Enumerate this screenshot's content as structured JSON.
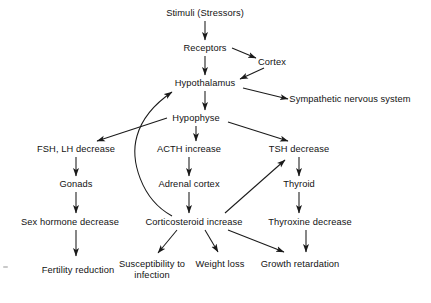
{
  "diagram": {
    "text_color": "#121212",
    "line_color": "#1a1a1a",
    "background": "#ffffff",
    "nodes": [
      {
        "id": "stimuli",
        "label": "Stimuli (Stressors)",
        "x": 205,
        "y": 13,
        "lines": 1
      },
      {
        "id": "receptors",
        "label": "Receptors",
        "x": 205,
        "y": 48,
        "lines": 1
      },
      {
        "id": "cortex",
        "label": "Cortex",
        "x": 272,
        "y": 62,
        "lines": 1
      },
      {
        "id": "hypothalamus",
        "label": "Hypothalamus",
        "x": 205,
        "y": 83,
        "lines": 1
      },
      {
        "id": "sympathetic",
        "label": "Sympathetic nervous system",
        "x": 350,
        "y": 99,
        "lines": 1
      },
      {
        "id": "hypophyse",
        "label": "Hypophyse",
        "x": 196,
        "y": 118,
        "lines": 1
      },
      {
        "id": "fsh_lh",
        "label": "FSH, LH decrease",
        "x": 76,
        "y": 149,
        "lines": 1
      },
      {
        "id": "acth",
        "label": "ACTH increase",
        "x": 189,
        "y": 149,
        "lines": 1
      },
      {
        "id": "tsh",
        "label": "TSH decrease",
        "x": 299,
        "y": 149,
        "lines": 1
      },
      {
        "id": "gonads",
        "label": "Gonads",
        "x": 76,
        "y": 184,
        "lines": 1
      },
      {
        "id": "adrenal_cortex",
        "label": "Adrenal cortex",
        "x": 189,
        "y": 184,
        "lines": 1
      },
      {
        "id": "thyroid",
        "label": "Thyroid",
        "x": 299,
        "y": 184,
        "lines": 1
      },
      {
        "id": "sex_hormone",
        "label": "Sex hormone decrease",
        "x": 70,
        "y": 222,
        "lines": 1
      },
      {
        "id": "corticosteroid",
        "label": "Corticosteroid increase",
        "x": 194,
        "y": 222,
        "lines": 1
      },
      {
        "id": "thyroxine",
        "label": "Thyroxine decrease",
        "x": 310,
        "y": 222,
        "lines": 1
      },
      {
        "id": "fertility",
        "label": "Fertility reduction",
        "x": 78,
        "y": 270,
        "lines": 2
      },
      {
        "id": "susceptibility",
        "label": "Susceptibility to infection",
        "x": 152,
        "y": 270,
        "lines": 2
      },
      {
        "id": "weight_loss",
        "label": "Weight loss",
        "x": 220,
        "y": 264,
        "lines": 1
      },
      {
        "id": "growth",
        "label": "Growth retardation",
        "x": 300,
        "y": 264,
        "lines": 1
      }
    ],
    "edges": [
      {
        "from": "stimuli",
        "to": "receptors",
        "kind": "straight"
      },
      {
        "from": "receptors",
        "to": "cortex",
        "kind": "straight"
      },
      {
        "from": "cortex",
        "to": "hypothalamus",
        "kind": "straight"
      },
      {
        "from": "receptors",
        "to": "hypothalamus",
        "kind": "straight"
      },
      {
        "from": "hypothalamus",
        "to": "sympathetic",
        "kind": "straight"
      },
      {
        "from": "hypothalamus",
        "to": "hypophyse",
        "kind": "straight"
      },
      {
        "from": "hypophyse",
        "to": "fsh_lh",
        "kind": "straight"
      },
      {
        "from": "hypophyse",
        "to": "acth",
        "kind": "straight"
      },
      {
        "from": "hypophyse",
        "to": "tsh",
        "kind": "straight"
      },
      {
        "from": "fsh_lh",
        "to": "gonads",
        "kind": "straight"
      },
      {
        "from": "acth",
        "to": "adrenal_cortex",
        "kind": "straight"
      },
      {
        "from": "tsh",
        "to": "thyroid",
        "kind": "straight"
      },
      {
        "from": "gonads",
        "to": "sex_hormone",
        "kind": "straight"
      },
      {
        "from": "adrenal_cortex",
        "to": "corticosteroid",
        "kind": "straight"
      },
      {
        "from": "thyroid",
        "to": "thyroxine",
        "kind": "straight"
      },
      {
        "from": "sex_hormone",
        "to": "fertility",
        "kind": "straight"
      },
      {
        "from": "corticosteroid",
        "to": "susceptibility",
        "kind": "straight"
      },
      {
        "from": "corticosteroid",
        "to": "weight_loss",
        "kind": "straight"
      },
      {
        "from": "corticosteroid",
        "to": "growth",
        "kind": "straight"
      },
      {
        "from": "thyroxine",
        "to": "growth",
        "kind": "straight"
      },
      {
        "from": "corticosteroid",
        "to": "tsh",
        "kind": "feedback-diagonal"
      },
      {
        "from": "corticosteroid",
        "to": "hypothalamus",
        "kind": "feedback-curve"
      }
    ]
  }
}
